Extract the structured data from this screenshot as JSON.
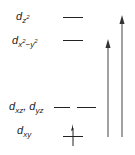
{
  "diagram": {
    "type": "d-orbital energy level diagram",
    "levels": [
      {
        "id": "dz2",
        "label_main": "d",
        "label_sub": "z",
        "label_sup": "2",
        "degeneracy": 1,
        "electrons": 0
      },
      {
        "id": "dx2y2",
        "label_main": "d",
        "label_sub": "x",
        "label_sup": "2",
        "label_sub2": "−y",
        "label_sup2": "2",
        "degeneracy": 1,
        "electrons": 0
      },
      {
        "id": "dxz_dyz",
        "label_main": "d",
        "label_sub": "xz",
        "label_sep": ", ",
        "label_main2": "d",
        "label_sub2": "yz",
        "degeneracy": 2,
        "electrons": 0
      },
      {
        "id": "dxy",
        "label_main": "d",
        "label_sub": "xy",
        "degeneracy": 1,
        "electrons": 1,
        "spin": "up"
      }
    ],
    "transitions": [
      {
        "from": "dxy",
        "to": "dx2y2",
        "direction": "up"
      },
      {
        "from": "dxy",
        "to": "dz2",
        "direction": "up"
      }
    ],
    "colors": {
      "line": "#222222",
      "arrow": "#444444",
      "background": "#ffffff"
    }
  }
}
